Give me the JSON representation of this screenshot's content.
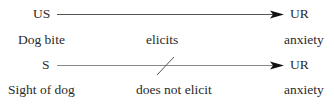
{
  "row1": {
    "left": "US",
    "right": "UR"
  },
  "row2": {
    "left": "Dog bite",
    "middle": "elicits",
    "right": "anxiety"
  },
  "row3": {
    "left": "S",
    "right": "UR"
  },
  "row4": {
    "left": "Sight of dog",
    "middle": "does not elicit",
    "right": "anxiety"
  },
  "colors": {
    "line": "#555555",
    "text": "#2a2a2a"
  }
}
